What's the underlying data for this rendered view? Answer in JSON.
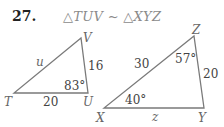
{
  "problem": {
    "number": "27.",
    "statement": "△TUV ~ △XYZ"
  },
  "triangle_tuv": {
    "vertices": {
      "T": "T",
      "U": "U",
      "V": "V"
    },
    "sides": {
      "TV": "u",
      "VU": "16",
      "TU": "20"
    },
    "angles": {
      "U": "83°"
    }
  },
  "triangle_xyz": {
    "vertices": {
      "X": "X",
      "Y": "Y",
      "Z": "Z"
    },
    "sides": {
      "XZ": "30",
      "ZY": "20",
      "XY": "z"
    },
    "angles": {
      "Z": "57°",
      "X": "40°"
    }
  },
  "colors": {
    "line": "#7a7a7a",
    "text": "#444444",
    "statement": "#8a8a8a"
  }
}
